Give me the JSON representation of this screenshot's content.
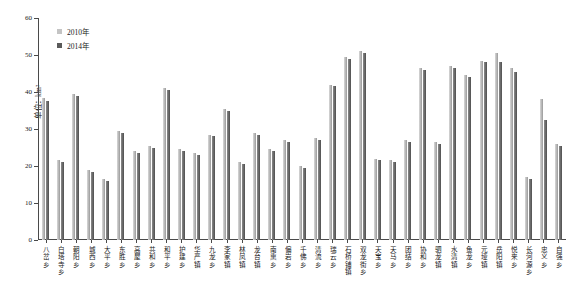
{
  "chart_data": {
    "type": "bar",
    "title": "",
    "xlabel": "",
    "ylabel": "单位：km²",
    "ylim": [
      0,
      60
    ],
    "ytick_labels": [
      "0",
      "10",
      "20",
      "30",
      "40",
      "50",
      "60"
    ],
    "ytick_values": [
      0,
      10,
      20,
      30,
      40,
      50,
      60
    ],
    "grid": false,
    "legend_position": "top-left",
    "categories": [
      "八岔乡",
      "白塔寺乡",
      "朝阳乡",
      "城西乡",
      "大平乡",
      "东胜乡",
      "高屋乡",
      "共和乡",
      "和平乡",
      "护建乡",
      "华严镇",
      "九龙乡",
      "李家镇",
      "林凤镇",
      "龙台镇",
      "南熏乡",
      "偏岩乡",
      "千佛乡",
      "清流乡",
      "瑞云乡",
      "石桥铺镇",
      "双龙街乡",
      "天宝乡",
      "天马乡",
      "团结乡",
      "协和乡",
      "驷龙镇",
      "水清镇",
      "鱼龙乡",
      "元垭镇",
      "岳阳镇",
      "悦来乡",
      "长河源乡",
      "忠义乡",
      "自强乡"
    ],
    "series": [
      {
        "name": "2010年",
        "color": "#c4c4c4",
        "values": [
          38.5,
          21.5,
          39.5,
          19.0,
          16.5,
          29.5,
          24.0,
          25.5,
          41.0,
          24.5,
          23.5,
          28.5,
          35.5,
          21.0,
          29.0,
          24.5,
          27.0,
          20.0,
          27.5,
          42.0,
          49.5,
          51.0,
          22.0,
          21.5,
          27.0,
          46.5,
          26.5,
          47.0,
          44.5,
          48.5,
          50.5,
          46.5,
          17.0,
          38.0,
          26.0
        ]
      },
      {
        "name": "2014年",
        "color": "#5a5a5a",
        "values": [
          37.5,
          21.0,
          39.0,
          18.5,
          16.0,
          29.0,
          23.5,
          25.0,
          40.5,
          24.0,
          23.0,
          28.0,
          35.0,
          20.5,
          28.5,
          24.0,
          26.5,
          19.5,
          27.0,
          41.5,
          49.0,
          50.5,
          21.5,
          21.0,
          26.5,
          46.0,
          26.0,
          46.5,
          44.0,
          48.0,
          48.0,
          45.5,
          16.5,
          32.5,
          25.5
        ]
      }
    ]
  },
  "legend": {
    "items": [
      {
        "label": "2010年"
      },
      {
        "label": "2014年"
      }
    ]
  }
}
